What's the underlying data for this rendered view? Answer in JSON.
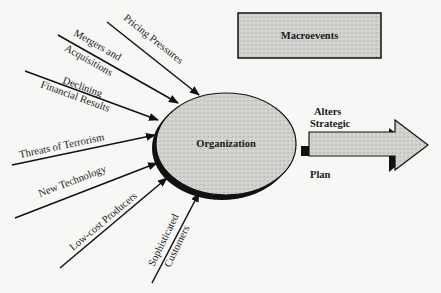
{
  "diagram": {
    "macro_box": {
      "label": "Macroevents"
    },
    "center": {
      "label": "Organization"
    },
    "output_arrow": {
      "label_line1": "Alters",
      "label_line2": "Strategic",
      "label_line3": "Plan"
    },
    "forces": [
      {
        "id": "pricing",
        "line1": "Pricing Pressures",
        "line2": ""
      },
      {
        "id": "mergers",
        "line1": "Mergers and",
        "line2": "Acquisitions"
      },
      {
        "id": "declining",
        "line1": "Declining",
        "line2": "Financial Results"
      },
      {
        "id": "terrorism",
        "line1": "Threats of Terrorism",
        "line2": ""
      },
      {
        "id": "technology",
        "line1": "New Technology",
        "line2": ""
      },
      {
        "id": "lowcost",
        "line1": "Low-cost Producers",
        "line2": ""
      },
      {
        "id": "customers",
        "line1": "Sophisticated",
        "line2": "Customers"
      }
    ],
    "colors": {
      "fill": "#c9c9c6",
      "stroke": "#111111",
      "background": "#f7f7f5"
    }
  }
}
